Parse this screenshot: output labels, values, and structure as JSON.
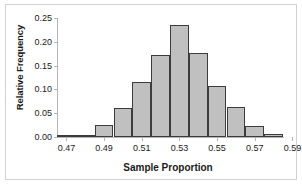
{
  "chart_data": {
    "type": "bar",
    "title": "",
    "subtitle": "",
    "xlabel": "Sample Proportion",
    "ylabel": "Relative Frequency",
    "xlim": [
      0.465,
      0.585
    ],
    "ylim": [
      0.0,
      0.25
    ],
    "bin_width": 0.01,
    "grid": false,
    "legend": "none",
    "bar_fill_color": "#c0c0c0",
    "bar_edge_color": "#3c3c3c",
    "axis_color": "#b5b5b5",
    "frame_color": "#d2d2d2",
    "xticks": [
      0.47,
      0.49,
      0.51,
      0.53,
      0.55,
      0.57,
      0.59
    ],
    "xtick_labels": [
      "0.47",
      "0.49",
      "0.51",
      "0.53",
      "0.55",
      "0.57",
      "0.59"
    ],
    "yticks": [
      0.0,
      0.05,
      0.1,
      0.15,
      0.2,
      0.25
    ],
    "ytick_labels": [
      "0.00",
      "0.05",
      "0.10",
      "0.15",
      "0.20",
      "0.25"
    ],
    "bin_centers": [
      0.47,
      0.48,
      0.49,
      0.5,
      0.51,
      0.52,
      0.53,
      0.54,
      0.55,
      0.56,
      0.57,
      0.58
    ],
    "bin_edges": [
      0.465,
      0.475,
      0.485,
      0.495,
      0.505,
      0.515,
      0.525,
      0.535,
      0.545,
      0.555,
      0.565,
      0.575,
      0.585
    ],
    "categories": [
      "0.465-0.475",
      "0.475-0.485",
      "0.485-0.495",
      "0.495-0.505",
      "0.505-0.515",
      "0.515-0.525",
      "0.525-0.535",
      "0.535-0.545",
      "0.545-0.555",
      "0.555-0.565",
      "0.565-0.575",
      "0.575-0.585"
    ],
    "values": [
      0.002,
      0.005,
      0.026,
      0.062,
      0.115,
      0.172,
      0.235,
      0.177,
      0.107,
      0.064,
      0.024,
      0.006
    ]
  }
}
